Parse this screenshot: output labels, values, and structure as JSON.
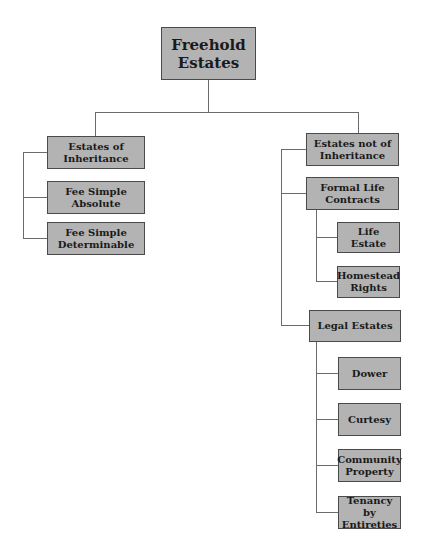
{
  "diagram": {
    "type": "tree",
    "title": "Freehold Estates",
    "colors": {
      "node_fill": "#b3b3b3",
      "node_border": "#4a4a4a",
      "connector": "#6b6b6b",
      "text": "#1a1a1a"
    },
    "root": {
      "label": "Freehold\nEstates"
    },
    "left_branch": {
      "label": "Estates of\nInheritance",
      "children": [
        {
          "label": "Fee Simple\nAbsolute"
        },
        {
          "label": "Fee Simple\nDeterminable"
        }
      ]
    },
    "right_branch": {
      "label": "Estates not of\nInheritance",
      "children": [
        {
          "label": "Formal Life\nContracts",
          "children": [
            {
              "label": "Life Estate"
            },
            {
              "label": "Homestead\nRights"
            }
          ]
        },
        {
          "label": "Legal Estates",
          "children": [
            {
              "label": "Dower"
            },
            {
              "label": "Curtesy"
            },
            {
              "label": "Community\nProperty"
            },
            {
              "label": "Tenancy by\nEntireties"
            }
          ]
        }
      ]
    }
  }
}
